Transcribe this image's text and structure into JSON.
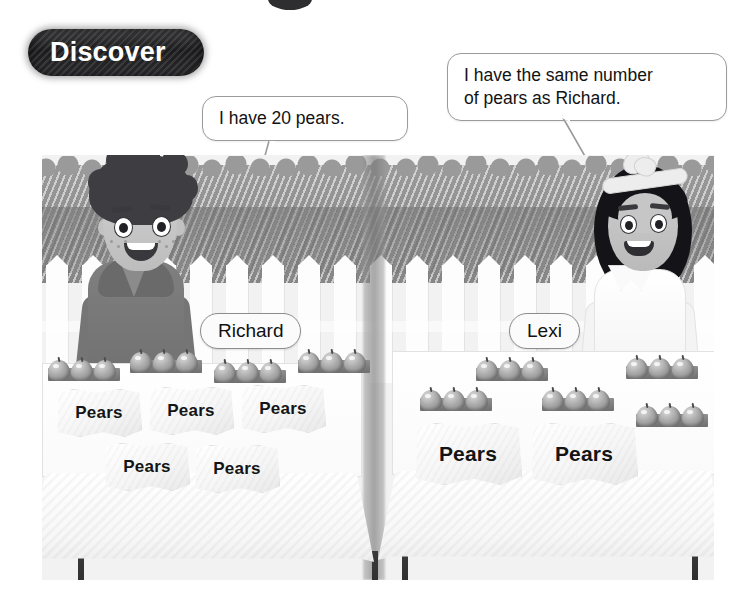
{
  "page": {
    "title": "Discover",
    "background_color": "#ffffff"
  },
  "badge": {
    "label": "Discover",
    "background_color": "#1b1b1d",
    "text_color": "#ffffff"
  },
  "speech_bubbles": [
    {
      "speaker": "Richard",
      "text": "I have 20 pears.",
      "position": "left"
    },
    {
      "speaker": "Lexi",
      "text": "I have the same number\nof pears as Richard.",
      "position": "right"
    }
  ],
  "characters": [
    {
      "name": "Richard",
      "nametag": "Richard",
      "hair": "curly dark",
      "clothing": "grey hoodie"
    },
    {
      "name": "Lexi",
      "nametag": "Lexi",
      "hair": "long dark with headband bow",
      "clothing": "white blouse"
    }
  ],
  "stalls": [
    {
      "owner": "Richard",
      "bag_label": "Pears",
      "bags": 5,
      "bag_rows": [
        3,
        2
      ],
      "trays": 4,
      "pears_per_tray": 3
    },
    {
      "owner": "Lexi",
      "bag_label": "Pears",
      "bags": 2,
      "bag_rows": [
        2
      ],
      "trays": 5,
      "pears_per_tray": 3
    }
  ],
  "scene": {
    "fence": "white picket fence",
    "hedge": "grey hedge",
    "table_count": 2
  },
  "colors": {
    "badge_dark": "#1b1b1d",
    "bubble_border": "#9b9b9b",
    "nametag_border": "#8d8d8d",
    "hedge": "#8c8c8c",
    "fence": "#fdfdfd",
    "pear": "#a9a9a9",
    "table_leg": "#2a2a2a"
  }
}
